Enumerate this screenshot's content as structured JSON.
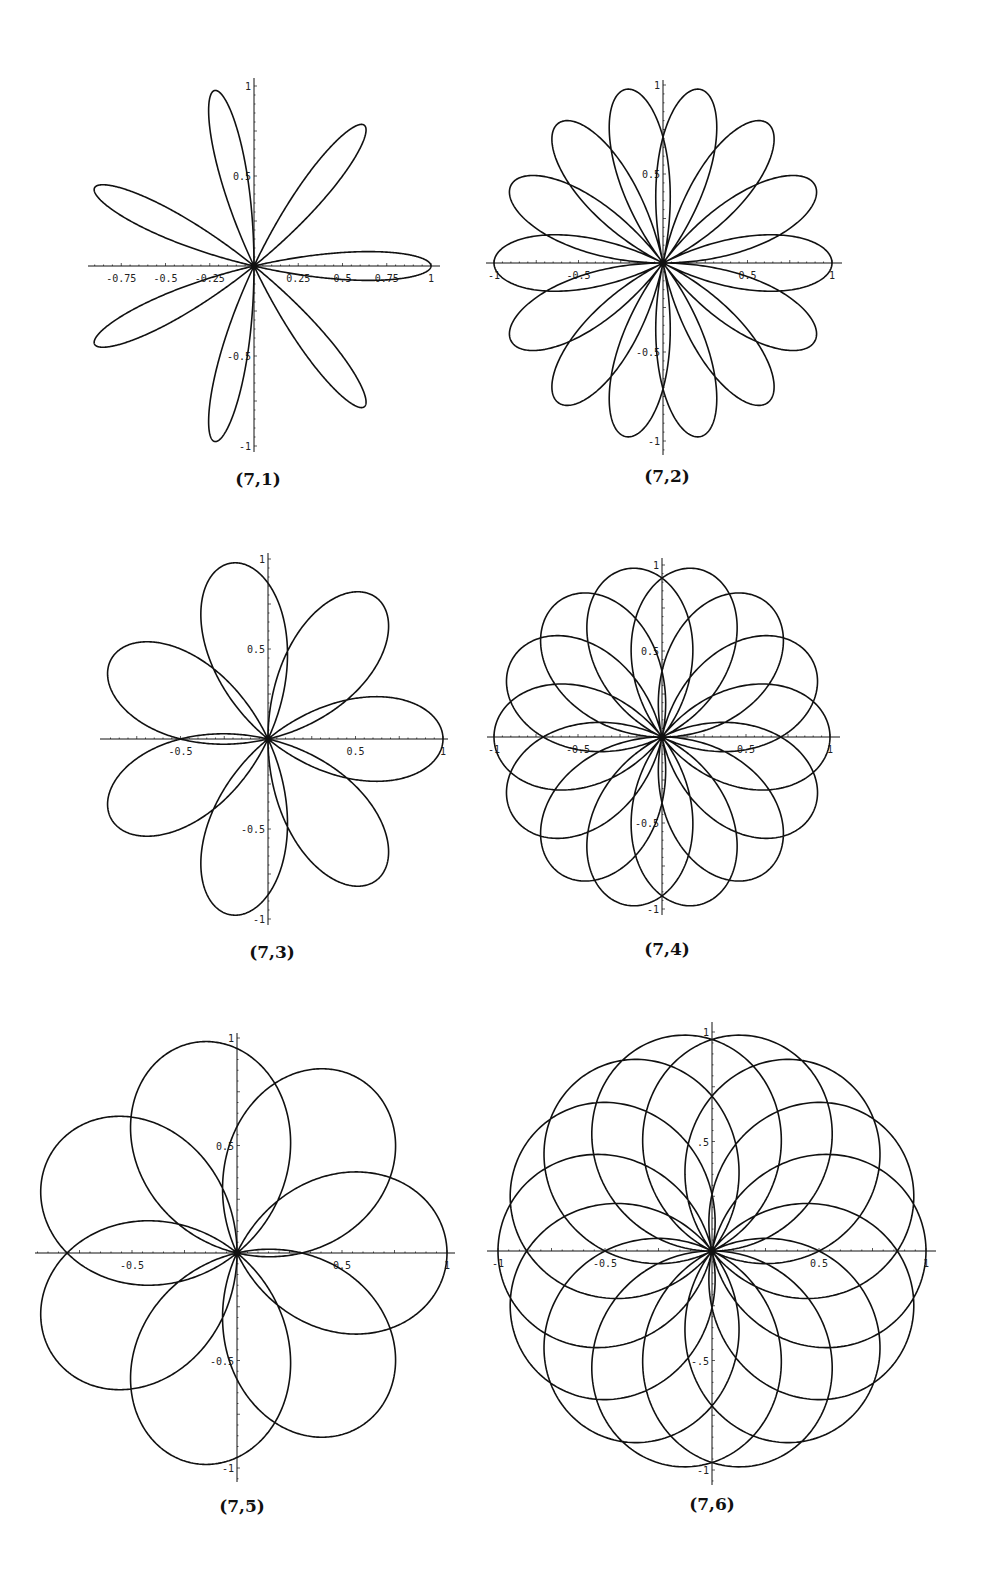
{
  "figure": {
    "ink_color": "#111111",
    "background": "#ffffff"
  },
  "chart_data": [
    {
      "type": "line",
      "title": "(7,1)",
      "curve": "polar rose r = cos(7θ/1)",
      "n": 7,
      "d": 1,
      "petals": 7,
      "xlim": [
        -1,
        1
      ],
      "ylim": [
        -1,
        1
      ],
      "x_tick_labels": [
        "-0.75",
        "-0.5",
        "-0.25",
        "0.25",
        "0.5",
        "0.75",
        "1"
      ],
      "x_tick_values": [
        -0.75,
        -0.5,
        -0.25,
        0.25,
        0.5,
        0.75,
        1
      ],
      "y_tick_labels": [
        "1",
        "0.5",
        "-0.5",
        "-1"
      ],
      "y_tick_values": [
        1,
        0.5,
        -0.5,
        -1
      ],
      "grid": false,
      "layout": {
        "cx": 254,
        "cy": 266,
        "ux": 177,
        "uy": 180,
        "xaxis": [
          88,
          440
        ],
        "yaxis": [
          78,
          452
        ]
      }
    },
    {
      "type": "line",
      "title": "(7,2)",
      "curve": "polar rose r = cos(7θ/2)",
      "n": 7,
      "d": 2,
      "petals": 14,
      "xlim": [
        -1,
        1
      ],
      "ylim": [
        -1,
        1
      ],
      "x_tick_labels": [
        "-1",
        "-0.5",
        "0.5",
        "1"
      ],
      "x_tick_values": [
        -1,
        -0.5,
        0.5,
        1
      ],
      "y_tick_labels": [
        "1",
        "0.5",
        "-0.5",
        "-1"
      ],
      "y_tick_values": [
        1,
        0.5,
        -0.5,
        -1
      ],
      "grid": false,
      "layout": {
        "cx": 663,
        "cy": 263,
        "ux": 169,
        "uy": 178,
        "xaxis": [
          486,
          842
        ],
        "yaxis": [
          80,
          455
        ]
      }
    },
    {
      "type": "line",
      "title": "(7,3)",
      "curve": "polar rose r = cos(7θ/3)",
      "n": 7,
      "d": 3,
      "petals": 7,
      "xlim": [
        -1,
        1
      ],
      "ylim": [
        -1,
        1
      ],
      "x_tick_labels": [
        "-0.5",
        "0.5",
        "1"
      ],
      "x_tick_values": [
        -0.5,
        0.5,
        1
      ],
      "y_tick_labels": [
        "1",
        "0.5",
        "-0.5",
        "-1"
      ],
      "y_tick_values": [
        1,
        0.5,
        -0.5,
        -1
      ],
      "grid": false,
      "layout": {
        "cx": 268,
        "cy": 739,
        "ux": 175,
        "uy": 180,
        "xaxis": [
          100,
          448
        ],
        "yaxis": [
          553,
          925
        ]
      }
    },
    {
      "type": "line",
      "title": "(7,4)",
      "curve": "polar rose r = cos(7θ/4)",
      "n": 7,
      "d": 4,
      "petals": 14,
      "xlim": [
        -1,
        1
      ],
      "ylim": [
        -1,
        1
      ],
      "x_tick_labels": [
        "-1",
        "-0.5",
        "0.5",
        "1"
      ],
      "x_tick_values": [
        -1,
        -0.5,
        0.5,
        1
      ],
      "y_tick_labels": [
        "1",
        "0.5",
        "-0.5",
        "-1"
      ],
      "y_tick_values": [
        1,
        0.5,
        -0.5,
        -1
      ],
      "grid": false,
      "layout": {
        "cx": 662,
        "cy": 737,
        "ux": 168,
        "uy": 172,
        "xaxis": [
          487,
          840
        ],
        "yaxis": [
          558,
          915
        ]
      }
    },
    {
      "type": "line",
      "title": "(7,5)",
      "curve": "polar rose r = cos(7θ/5)",
      "n": 7,
      "d": 5,
      "petals": 7,
      "xlim": [
        -1,
        1
      ],
      "ylim": [
        -1,
        1
      ],
      "x_tick_labels": [
        "-0.5",
        "0.5",
        "1"
      ],
      "x_tick_values": [
        -0.5,
        0.5,
        1
      ],
      "y_tick_labels": [
        "1",
        "0.5",
        "-0.5",
        "-1"
      ],
      "y_tick_values": [
        1,
        0.5,
        -0.5,
        -1
      ],
      "grid": false,
      "layout": {
        "cx": 237,
        "cy": 1253,
        "ux": 210,
        "uy": 215,
        "xaxis": [
          35,
          455
        ],
        "yaxis": [
          1033,
          1482
        ]
      }
    },
    {
      "type": "line",
      "title": "(7,6)",
      "curve": "polar rose r = cos(7θ/6)",
      "n": 7,
      "d": 6,
      "petals": 14,
      "xlim": [
        -1,
        1
      ],
      "ylim": [
        -1,
        1
      ],
      "x_tick_labels": [
        "-1",
        "-0.5",
        "0.5",
        "1"
      ],
      "x_tick_values": [
        -1,
        -0.5,
        0.5,
        1
      ],
      "y_tick_labels": [
        "1",
        ".5",
        "-.5",
        "-1"
      ],
      "y_tick_values": [
        1,
        0.5,
        -0.5,
        -1
      ],
      "grid": false,
      "layout": {
        "cx": 712,
        "cy": 1251,
        "ux": 214,
        "uy": 219,
        "xaxis": [
          487,
          936
        ],
        "yaxis": [
          1022,
          1485
        ]
      }
    }
  ],
  "captions": [
    {
      "label": "(7,1)",
      "x": 258,
      "y": 469
    },
    {
      "label": "(7,2)",
      "x": 667,
      "y": 466
    },
    {
      "label": "(7,3)",
      "x": 272,
      "y": 942
    },
    {
      "label": "(7,4)",
      "x": 667,
      "y": 939
    },
    {
      "label": "(7,5)",
      "x": 242,
      "y": 1496
    },
    {
      "label": "(7,6)",
      "x": 712,
      "y": 1494
    }
  ]
}
